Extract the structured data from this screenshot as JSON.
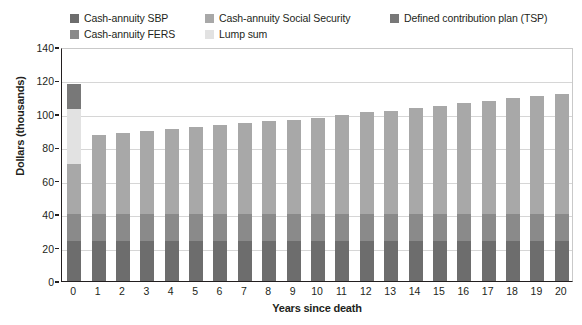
{
  "chart_data": {
    "type": "bar",
    "stacked": true,
    "title": "",
    "xlabel": "Years since death",
    "ylabel": "Dollars (thousands)",
    "ylim": [
      0,
      140
    ],
    "ytick_step": 20,
    "yticks": [
      0,
      20,
      40,
      60,
      80,
      100,
      120,
      140
    ],
    "grid": true,
    "legend_position": "top",
    "categories": [
      "0",
      "1",
      "2",
      "3",
      "4",
      "5",
      "6",
      "7",
      "8",
      "9",
      "10",
      "11",
      "12",
      "13",
      "14",
      "15",
      "16",
      "17",
      "18",
      "19",
      "20"
    ],
    "series": [
      {
        "name": "Cash-annuity SBP",
        "color": "#6d6d6d",
        "values": [
          24,
          24,
          24,
          24,
          24,
          24,
          24,
          24,
          24,
          24,
          24,
          24,
          24,
          24,
          24,
          24,
          24,
          24,
          24,
          24,
          24
        ]
      },
      {
        "name": "Cash-annuity FERS",
        "color": "#8a8a8a",
        "values": [
          16,
          16,
          16,
          16,
          16,
          16,
          16,
          16,
          16,
          16,
          16,
          16,
          16,
          16,
          16,
          16,
          16,
          16,
          16,
          16,
          16
        ]
      },
      {
        "name": "Cash-annuity Social Security",
        "color": "#a8a8a8",
        "values": [
          30,
          47.5,
          48.5,
          49.5,
          51,
          52,
          53.5,
          54.5,
          55.5,
          56.5,
          57.5,
          59.5,
          61,
          62,
          63.5,
          64.5,
          66.5,
          68,
          69.5,
          70.5,
          72
        ]
      },
      {
        "name": "Lump sum",
        "color": "#e2e2e2",
        "values": [
          33,
          0,
          0,
          0,
          0,
          0,
          0,
          0,
          0,
          0,
          0,
          0,
          0,
          0,
          0,
          0,
          0,
          0,
          0,
          0,
          0
        ]
      },
      {
        "name": "Defined contribution plan (TSP)",
        "color": "#787878",
        "values": [
          15,
          0,
          0,
          0,
          0,
          0,
          0,
          0,
          0,
          0,
          0,
          0,
          0,
          0,
          0,
          0,
          0,
          0,
          0,
          0,
          0
        ]
      }
    ],
    "totals": [
      118,
      87.5,
      88.5,
      89.5,
      91,
      92,
      93.5,
      94.5,
      95.5,
      96.5,
      97.5,
      99.5,
      101,
      102,
      103.5,
      104.5,
      106.5,
      108,
      109.5,
      110.5,
      112
    ]
  },
  "legend": {
    "items": [
      {
        "label": "Cash-annuity SBP",
        "color": "#6d6d6d"
      },
      {
        "label": "Cash-annuity FERS",
        "color": "#8a8a8a"
      },
      {
        "label": "Cash-annuity Social Security",
        "color": "#a8a8a8"
      },
      {
        "label": "Lump sum",
        "color": "#e2e2e2"
      },
      {
        "label": "Defined contribution plan (TSP)",
        "color": "#787878"
      }
    ]
  }
}
